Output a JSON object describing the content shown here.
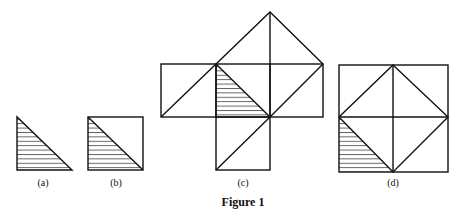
{
  "figure": {
    "caption": "Figure 1",
    "panels": [
      {
        "id": "a",
        "label": "(a)",
        "description": "Single hatched right triangle"
      },
      {
        "id": "b",
        "label": "(b)",
        "description": "Square split by diagonal, lower-left triangle hatched"
      },
      {
        "id": "c",
        "label": "(c)",
        "description": "Central hatched triangle with squares on its sides, each split by diagonals"
      },
      {
        "id": "d",
        "label": "(d)",
        "description": "Large square with inscribed diamond; lower-left corner triangle hatched"
      }
    ]
  },
  "colors": {
    "stroke": "#111111",
    "hatch": "#333333",
    "background": "#ffffff"
  }
}
